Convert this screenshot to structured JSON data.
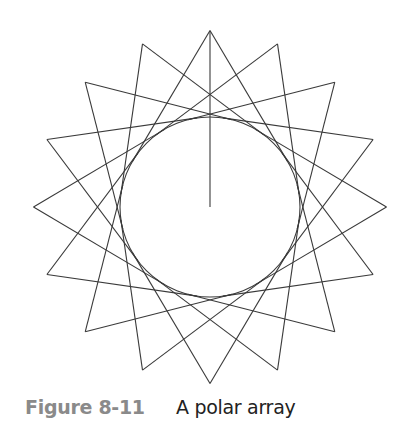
{
  "figure": {
    "center": [
      210,
      207
    ],
    "circle_radius": 90,
    "apex_radius": 176.5,
    "count": 16,
    "start_angle_deg": 0,
    "tangent_offset_deg": 59.3,
    "center_line": {
      "from": [
        210,
        31
      ],
      "to": [
        210,
        207
      ]
    },
    "stroke_color": "#3a3a3a"
  },
  "caption": {
    "label": "Figure 8-11",
    "text": "A polar array",
    "label_color": "#8a8a8a",
    "text_color": "#222222"
  }
}
